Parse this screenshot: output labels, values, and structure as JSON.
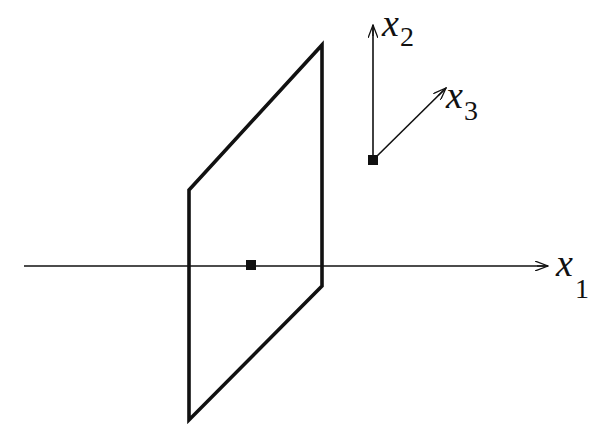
{
  "diagram": {
    "colors": {
      "stroke": "#111111",
      "background": "#ffffff"
    },
    "axes": {
      "x1": {
        "var": "x",
        "sub": "1"
      },
      "x2": {
        "var": "x",
        "sub": "2"
      },
      "x3": {
        "var": "x",
        "sub": "3"
      }
    },
    "geometry": {
      "x1_axis": {
        "from": [
          24,
          266
        ],
        "to": [
          548,
          266
        ]
      },
      "frame_origin": [
        373,
        160
      ],
      "x2_axis": {
        "from": [
          373,
          160
        ],
        "to": [
          373,
          25
        ]
      },
      "x3_axis": {
        "from": [
          373,
          160
        ],
        "to": [
          446,
          88
        ]
      },
      "parallelogram": [
        [
          189,
          190
        ],
        [
          322,
          45
        ],
        [
          322,
          286
        ],
        [
          189,
          420
        ]
      ],
      "center_point": [
        251,
        265
      ]
    }
  }
}
